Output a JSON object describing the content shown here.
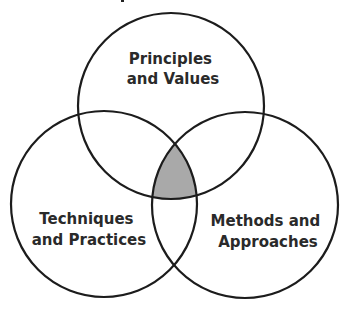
{
  "diagram": {
    "type": "venn",
    "sets": [
      {
        "id": "top",
        "label_lines": [
          "Principles",
          "and Values"
        ],
        "center": [
          171,
          106
        ],
        "radius": 93
      },
      {
        "id": "left",
        "label_lines": [
          "Techniques",
          "and Practices"
        ],
        "center": [
          104,
          204
        ],
        "radius": 93
      },
      {
        "id": "right",
        "label_lines": [
          "Methods and",
          "Approaches"
        ],
        "center": [
          245,
          205
        ],
        "radius": 93
      }
    ],
    "highlight": {
      "region": "intersection-all-three",
      "fill_color": "#a9a9a9"
    },
    "stroke_color": "#1c1c1c",
    "background_color": "#ffffff"
  }
}
